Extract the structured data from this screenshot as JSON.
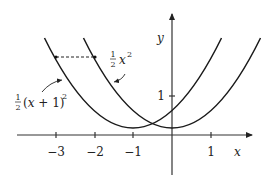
{
  "diagram": {
    "type": "function-graph",
    "axes": {
      "x_label": "x",
      "y_label": "y",
      "x_ticks": [
        {
          "value": -3,
          "label": "−3"
        },
        {
          "value": -2,
          "label": "−2"
        },
        {
          "value": -1,
          "label": "−1"
        },
        {
          "value": 1,
          "label": "1"
        }
      ],
      "y_ticks": [
        {
          "value": 1,
          "label": "1"
        }
      ]
    },
    "curves": [
      {
        "name": "half-x-squared",
        "label_frac": "½",
        "label_expr": "x",
        "label_exp": "2",
        "formula": "1/2 x^2"
      },
      {
        "name": "half-x-plus-one-squared",
        "label_frac": "½",
        "label_expr": "(x + 1)",
        "label_exp": "2",
        "formula": "1/2 (x+1)^2"
      }
    ],
    "dashed_segment": {
      "y": 2,
      "from_x": -3,
      "to_x": -2
    }
  },
  "colors": {
    "stroke": "#1a1a1a",
    "axis": "#333333"
  }
}
